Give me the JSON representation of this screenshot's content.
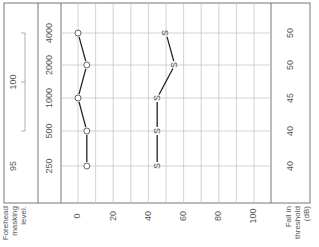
{
  "chart_data": {
    "type": "line",
    "title": "",
    "orientation": "rotated-90-ccw",
    "frequency_axis": {
      "label": "Frequency (Hz)",
      "ticks": [
        "250",
        "500",
        "1000",
        "2000",
        "4000"
      ]
    },
    "level_axis": {
      "label": "",
      "ticks": [
        "0",
        "20",
        "40",
        "60",
        "80",
        "100"
      ],
      "range": [
        -10,
        110
      ],
      "minor_step": 10
    },
    "series": [
      {
        "name": "Unmasked threshold",
        "marker": "O",
        "x": [
          "250",
          "500",
          "1000",
          "2000",
          "4000"
        ],
        "values": [
          5,
          5,
          0,
          5,
          0
        ]
      },
      {
        "name": "Masked threshold",
        "marker": "S",
        "x": [
          "250",
          "500",
          "1000",
          "2000",
          "4000"
        ],
        "values": [
          45,
          45,
          45,
          55,
          50
        ]
      }
    ],
    "left_column": {
      "label_lines": [
        "Forehead",
        "masking",
        "level."
      ],
      "entries": [
        {
          "text": "95",
          "frequencies": [
            "250"
          ]
        },
        {
          "text": "100",
          "frequencies": [
            "500",
            "1000",
            "2000",
            "4000"
          ],
          "bracket": true
        }
      ]
    },
    "right_column": {
      "label_lines": [
        "Fall in",
        "threshold",
        "(dB)"
      ],
      "values": [
        {
          "frequency": "250",
          "text": "40"
        },
        {
          "frequency": "500",
          "text": "40"
        },
        {
          "frequency": "1000",
          "text": "45"
        },
        {
          "frequency": "2000",
          "text": "50"
        },
        {
          "frequency": "4000",
          "text": "50"
        }
      ]
    },
    "grid": true,
    "legend": "none"
  }
}
